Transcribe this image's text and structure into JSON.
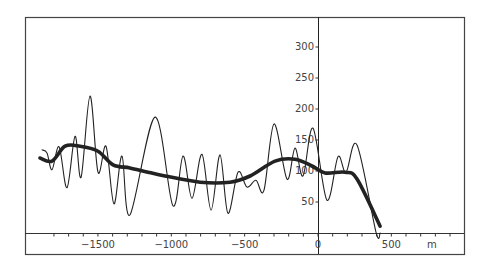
{
  "chart_data": {
    "type": "line",
    "title": "",
    "xlabel": "m",
    "ylabel": "",
    "xlim": [
      -1880,
      1000
    ],
    "ylim": [
      0,
      350
    ],
    "grid": false,
    "legend": null,
    "x_ticks": [
      -1500,
      -1000,
      -500,
      0,
      500
    ],
    "x_tick_labels": [
      "-1500",
      "-1000",
      "-500",
      "0",
      "500"
    ],
    "y_ticks": [
      50,
      100,
      150,
      200,
      250,
      300
    ],
    "y_tick_labels": [
      "50",
      "100",
      "150",
      "200",
      "250",
      "300"
    ],
    "series": [
      {
        "name": "raw profile (thin)",
        "style": "thin",
        "points": [
          [
            -1881,
            134
          ],
          [
            -1847,
            129
          ],
          [
            -1813,
            102
          ],
          [
            -1765,
            139
          ],
          [
            -1711,
            73
          ],
          [
            -1656,
            156
          ],
          [
            -1615,
            90
          ],
          [
            -1554,
            221
          ],
          [
            -1500,
            98
          ],
          [
            -1445,
            140
          ],
          [
            -1391,
            47
          ],
          [
            -1336,
            124
          ],
          [
            -1282,
            29
          ],
          [
            -1111,
            187
          ],
          [
            -989,
            44
          ],
          [
            -920,
            124
          ],
          [
            -859,
            56
          ],
          [
            -791,
            127
          ],
          [
            -729,
            37
          ],
          [
            -668,
            126
          ],
          [
            -614,
            32
          ],
          [
            -545,
            98
          ],
          [
            -484,
            74
          ],
          [
            -423,
            85
          ],
          [
            -368,
            69
          ],
          [
            -300,
            176
          ],
          [
            -211,
            87
          ],
          [
            -157,
            137
          ],
          [
            -102,
            92
          ],
          [
            -34,
            169
          ],
          [
            61,
            53
          ],
          [
            136,
            123
          ],
          [
            191,
            98
          ],
          [
            266,
            142
          ],
          [
            395,
            2
          ],
          [
            423,
            0
          ]
        ]
      },
      {
        "name": "smoothed profile (thick)",
        "style": "thick",
        "points": [
          [
            -1895,
            121
          ],
          [
            -1813,
            116
          ],
          [
            -1724,
            140
          ],
          [
            -1622,
            140
          ],
          [
            -1500,
            132
          ],
          [
            -1397,
            110
          ],
          [
            -1282,
            105
          ],
          [
            -1159,
            98
          ],
          [
            -1043,
            92
          ],
          [
            -804,
            82
          ],
          [
            -600,
            82
          ],
          [
            -463,
            92
          ],
          [
            -293,
            116
          ],
          [
            -157,
            119
          ],
          [
            -41,
            108
          ],
          [
            48,
            97
          ],
          [
            184,
            98
          ],
          [
            266,
            87
          ],
          [
            423,
            11
          ]
        ]
      }
    ]
  },
  "axis_unit_label": "m"
}
